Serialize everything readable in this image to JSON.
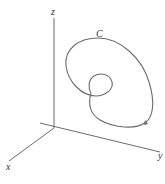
{
  "figure": {
    "labels": {
      "z_axis": "z",
      "y_axis": "y",
      "x_axis": "x",
      "curve": "C"
    },
    "colors": {
      "axis": "#5a5a5a",
      "curve": "#6a6a6a",
      "background": "#ffffff"
    },
    "caption_fragment": ""
  }
}
